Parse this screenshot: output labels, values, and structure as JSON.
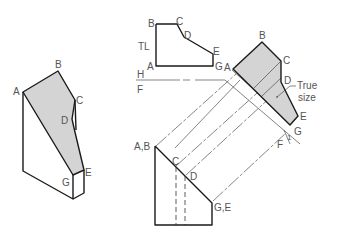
{
  "diagram": {
    "pictorial": {
      "labels": {
        "A": "A",
        "B": "B",
        "C": "C",
        "D": "D",
        "E": "E",
        "G": "G"
      }
    },
    "top_view": {
      "labels": {
        "B": "B",
        "C": "C",
        "D": "D",
        "E": "E",
        "G": "G",
        "A": "A",
        "TL": "TL"
      }
    },
    "fold_line": {
      "upper": "H",
      "lower": "F"
    },
    "auxiliary_view": {
      "labels": {
        "A": "A",
        "B": "B",
        "C": "C",
        "D": "D",
        "E": "E",
        "G": "G",
        "F": "F",
        "one": "1"
      },
      "note_line1": "True",
      "note_line2": "size"
    },
    "front_view": {
      "labels": {
        "AB": "A,B",
        "C": "C",
        "D": "D",
        "GE": "G,E"
      }
    },
    "colors": {
      "shaded_face": "#d4d4d4",
      "line": "#1a1a1a",
      "label": "#555555"
    }
  }
}
